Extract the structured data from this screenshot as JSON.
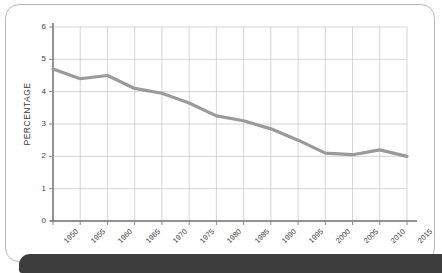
{
  "chart_data": {
    "type": "line",
    "title": "",
    "xlabel": "",
    "ylabel": "PERCENTAGE",
    "ylim": [
      0,
      6
    ],
    "yticks": [
      "0",
      "1",
      "2",
      "3",
      "4",
      "5",
      "6"
    ],
    "grid": true,
    "legend": "none",
    "line_color": "#9a9a9a",
    "categories": [
      "1950",
      "1955",
      "1960",
      "1965",
      "1970",
      "1975",
      "1980",
      "1985",
      "1990",
      "1995",
      "2000",
      "2005",
      "2010",
      "2015"
    ],
    "values": [
      4.7,
      4.4,
      4.5,
      4.1,
      3.95,
      3.65,
      3.25,
      3.1,
      2.85,
      2.5,
      2.1,
      2.05,
      2.2,
      2.0
    ]
  },
  "card": {
    "border_color": "#b8b8b8",
    "background": "#ffffff"
  },
  "bottom_bar": {
    "color": "#3d3d3d"
  }
}
